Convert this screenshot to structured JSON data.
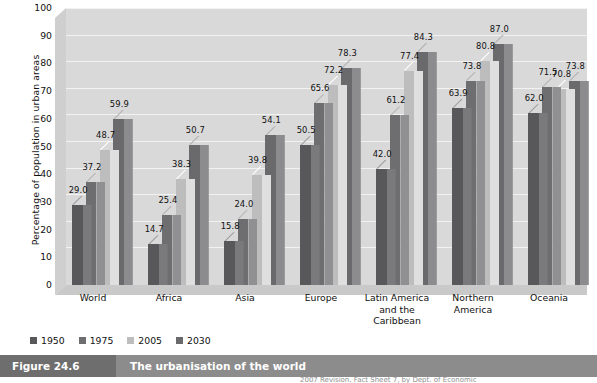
{
  "figure": {
    "number": "Figure 24.6",
    "caption": "The urbanisation of the world",
    "source_partial": "2007 Revision. Fact Sheet 7, by Dept. of Economic"
  },
  "chart_data": {
    "type": "bar",
    "title": "The urbanisation of the world",
    "xlabel": "",
    "ylabel": "Percentage of population in urban areas",
    "ylim": [
      0,
      100
    ],
    "ytick_step": 10,
    "yticks": [
      0,
      10,
      20,
      30,
      40,
      50,
      60,
      70,
      80,
      90,
      100
    ],
    "grid": true,
    "legend_position": "bottom-left",
    "three_d": true,
    "categories": [
      "World",
      "Africa",
      "Asia",
      "Europe",
      "Latin America and the Caribbean",
      "Northern America",
      "Oceania"
    ],
    "series": [
      {
        "name": "1950",
        "color": "#58585a",
        "values": [
          29.0,
          14.7,
          15.8,
          50.5,
          42.0,
          63.9,
          62.0
        ]
      },
      {
        "name": "1975",
        "color": "#6e6e70",
        "values": [
          37.2,
          25.4,
          24.0,
          65.6,
          61.2,
          73.8,
          71.5
        ]
      },
      {
        "name": "2005",
        "color": "#bdbdbd",
        "values": [
          48.7,
          38.3,
          39.8,
          72.2,
          77.4,
          80.8,
          70.8
        ]
      },
      {
        "name": "2030",
        "color": "#6a6a6c",
        "values": [
          59.9,
          50.7,
          54.1,
          78.3,
          84.3,
          87.0,
          73.8
        ]
      }
    ],
    "value_label_format": "one-decimal"
  },
  "colors": {
    "plot_background": "#d9d9d9",
    "gridline": "#f2f2f2",
    "caption_band": "#8c8c8c",
    "caption_number_band": "#6e6e6e",
    "text": "#111111"
  }
}
